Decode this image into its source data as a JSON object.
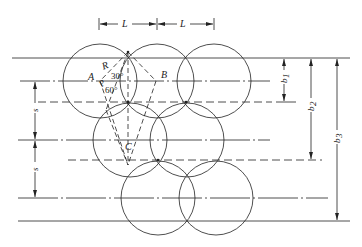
{
  "diagram": {
    "labels": {
      "L1": "L",
      "L2": "L",
      "A": "A",
      "B": "B",
      "C": "C",
      "R": "R",
      "P": "P",
      "angle30": "30°",
      "angle60": "60°",
      "s1": "s",
      "s2": "s",
      "b1": "b",
      "b1_sub": "1",
      "b2": "b",
      "b2_sub": "2",
      "b3": "b",
      "b3_sub": "3"
    },
    "colors": {
      "stroke": "#222222",
      "background": "#ffffff"
    },
    "geometry": {
      "radius": 37,
      "row1_circles_x": [
        100,
        157,
        214
      ],
      "row1_y": 81,
      "row2_circles_x": [
        130,
        187
      ],
      "row2_y": 140,
      "row3_circles_x": [
        158,
        216
      ],
      "row3_y": 198
    }
  }
}
